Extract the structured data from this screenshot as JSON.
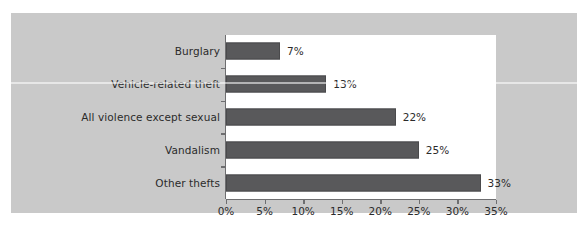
{
  "chart_data": {
    "type": "bar",
    "orientation": "horizontal",
    "title": "",
    "subtitle": "",
    "xlabel": "",
    "ylabel": "",
    "categories": [
      "Burglary",
      "Vehicle-related theft",
      "All violence except sexual",
      "Vandalism",
      "Other thefts"
    ],
    "values": [
      7,
      13,
      22,
      25,
      33
    ],
    "value_labels": [
      "7%",
      "13%",
      "22%",
      "25%",
      "33%"
    ],
    "xlim": [
      0,
      35
    ],
    "xticks": [
      0,
      5,
      10,
      15,
      20,
      25,
      30,
      35
    ],
    "xtick_labels": [
      "0%",
      "5%",
      "10%",
      "15%",
      "20%",
      "25%",
      "30%",
      "35%"
    ],
    "grid": false,
    "legend": null,
    "colors": {
      "bar": "#59595b",
      "bar_edge": "#4a4a4c",
      "figure_background": "#c9c9c9",
      "plot_background": "#ffffff",
      "axis": "#6e6e70",
      "text": "#2b2b2b",
      "page_background": "#ffffff"
    }
  }
}
